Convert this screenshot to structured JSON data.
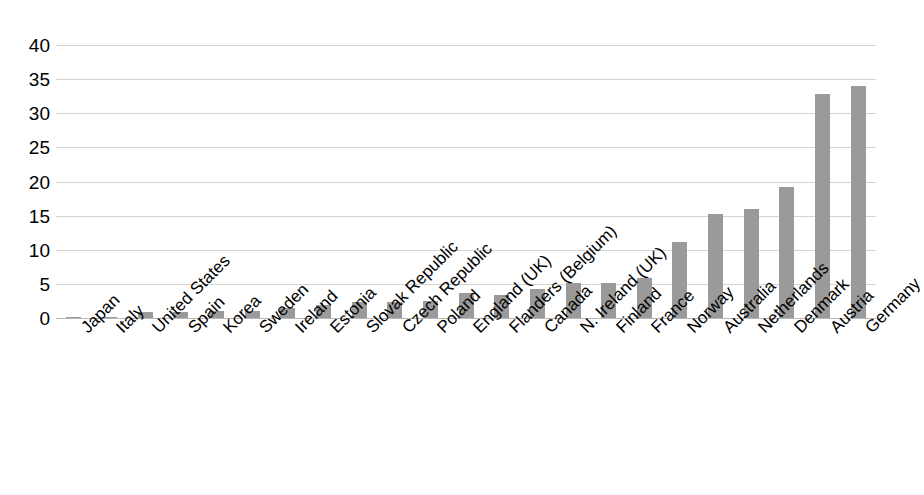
{
  "chart_data": {
    "type": "bar",
    "title": "",
    "subtitle": "",
    "xlabel": "",
    "ylabel": "",
    "ylim": [
      0,
      40
    ],
    "yticks": [
      0,
      5,
      10,
      15,
      20,
      25,
      30,
      35,
      40
    ],
    "ytick_labels": [
      "0",
      "5",
      "10",
      "15",
      "20",
      "25",
      "30",
      "35",
      "40"
    ],
    "grid": true,
    "legend": false,
    "legend_position": "none",
    "bar_color": "#9a9a9a",
    "gridline_color": "#d4d4d4",
    "axis_color": "#b8b8b8",
    "categories": [
      "Japan",
      "Italy",
      "United States",
      "Spain",
      "Korea",
      "Sweden",
      "Ireland",
      "Estonia",
      "Slovak Republic",
      "Czech Republic",
      "Poland",
      "England (UK)",
      "Flanders (Belgium)",
      "Canada",
      "N. Ireland (UK)",
      "Finland",
      "France",
      "Norway",
      "Australia",
      "Netherlands",
      "Denmark",
      "Austria",
      "Germany"
    ],
    "values": [
      0.1,
      0.2,
      0.9,
      0.9,
      1.0,
      1.0,
      1.5,
      1.9,
      2.3,
      2.3,
      2.5,
      3.6,
      3.4,
      4.3,
      5.1,
      5.1,
      5.9,
      11.1,
      15.2,
      16.0,
      19.2,
      32.8,
      34.0
    ]
  }
}
